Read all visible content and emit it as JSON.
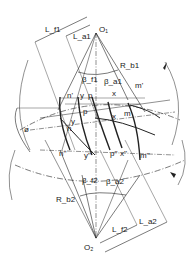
{
  "diagram": {
    "labels": {
      "O1": "O₁",
      "O2": "O₂",
      "Lf1": "L_f1",
      "La1": "L_a1",
      "Lf2": "L_f2",
      "La2": "L_a2",
      "Rb1": "R_b1",
      "Rb2": "R_b2",
      "Bf1": "β_f1",
      "Ba1": "β_a1",
      "Bf2": "β_f2",
      "Ba2": "β_a2",
      "phi": "ø",
      "n1": "n'",
      "y1": "y",
      "p1": "p",
      "x1": "x",
      "m1": "m'",
      "p_mid": "p",
      "x_mid": "x",
      "y_mid": "y",
      "m_mid": "m",
      "n_mid": "n",
      "n2": "n''",
      "y2": "y''",
      "p2": "p''",
      "x2": "x''",
      "m2": "m''"
    },
    "colors": {
      "line": "#222222",
      "background": "#ffffff"
    }
  }
}
